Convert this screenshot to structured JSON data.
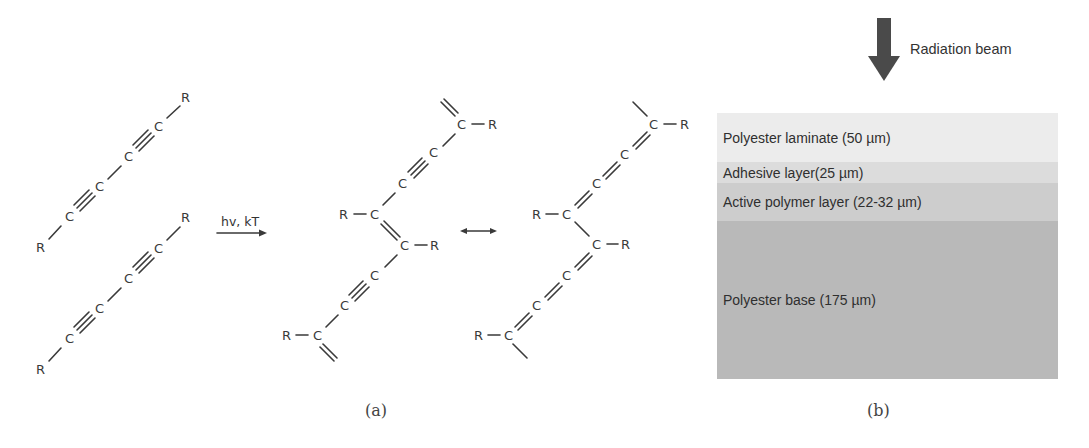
{
  "panel_a": {
    "caption": "(a)",
    "reaction_conditions": "hv, kT",
    "atom_labels": {
      "carbon": "C",
      "substituent": "R"
    },
    "monomers": [
      {
        "name": "diacetylene-monomer-1",
        "sequence": "R-C≡C-C≡C-R"
      },
      {
        "name": "diacetylene-monomer-2",
        "sequence": "R-C≡C-C≡C-R"
      }
    ],
    "polymer_forms": [
      {
        "name": "ene-yne form",
        "description": "=C(R)-C≡C-C(R)="
      },
      {
        "name": "butatriene form",
        "description": "-C(R)=C=C=C(R)-"
      }
    ],
    "resonance_symbol": "↔"
  },
  "panel_b": {
    "caption": "(b)",
    "beam_label": "Radiation beam",
    "layers": [
      {
        "label": "Polyester laminate (50 µm)",
        "color": "#ececec",
        "top": 0,
        "height": 49
      },
      {
        "label": "Adhesive layer(25 µm)",
        "color": "#dcdcdc",
        "top": 49,
        "height": 21
      },
      {
        "label": "Active polymer layer (22-32 µm)",
        "color": "#cdcdcd",
        "top": 70,
        "height": 38
      },
      {
        "label": "Polyester base (175 µm)",
        "color": "#b9b9b9",
        "top": 108,
        "height": 158
      }
    ],
    "arrow_color": "#4a4a4a"
  }
}
